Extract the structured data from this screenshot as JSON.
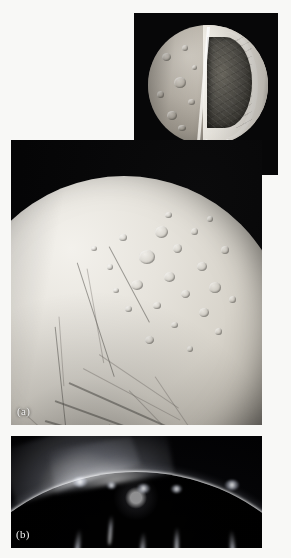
{
  "figure": {
    "labels": {
      "panel_a": "(a)",
      "panel_b": "(b)"
    },
    "panels": [
      {
        "id": "inset",
        "name": "enceladus-interior-cutaway",
        "description": "Cutaway model of Enceladus showing gray cratered icy crust on the left, bright ice shell, subsurface liquid water ocean and dark rocky core revealed on the right, with jets venting from the south pole.",
        "background_color": "#070708",
        "features": {
          "crust_color": "#b8b2a8",
          "ice_shell_color": "#f2efe8",
          "ocean_core_color": "#4a4842",
          "jet_count": 3
        }
      },
      {
        "id": "a",
        "name": "enceladus-surface-disc",
        "description": "Cassini image of the icy moon Enceladus: a bright crescent disc with impact craters in the north and long fractures (tiger stripes) crossing the southern terrain, against black space.",
        "background_color": "#050506",
        "features": {
          "surface_color": "#e7e4dd",
          "shadow_color": "#201f1e",
          "crater_count": 34,
          "fracture_count": 18
        }
      },
      {
        "id": "b",
        "name": "enceladus-south-polar-plumes",
        "description": "Backlit view of the limb of Enceladus showing bright icy jets and a diffuse plume erupting from the south polar region into dark space.",
        "background_color": "#030304",
        "features": {
          "limb_glow_color": "#ffffff",
          "plume_color": "#eef2ff",
          "plume_count": 5
        }
      }
    ]
  }
}
